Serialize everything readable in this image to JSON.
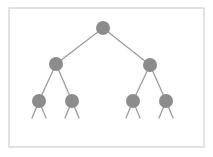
{
  "diagram": {
    "type": "binary-tree",
    "depth_shown": 3,
    "frame": {
      "x": 9,
      "y": 8,
      "width": 195,
      "height": 139,
      "stroke": "#cfcfcf"
    },
    "colors": {
      "node": "#8c8c8c",
      "edge": "#9c9c9c",
      "background": "#ffffff"
    },
    "node_radius": 7,
    "nodes": [
      {
        "id": "root",
        "level": 0,
        "x": 103,
        "y": 28
      },
      {
        "id": "l",
        "level": 1,
        "x": 56,
        "y": 64
      },
      {
        "id": "r",
        "level": 1,
        "x": 150,
        "y": 65
      },
      {
        "id": "ll",
        "level": 2,
        "x": 39,
        "y": 101
      },
      {
        "id": "lr",
        "level": 2,
        "x": 72,
        "y": 101
      },
      {
        "id": "rl",
        "level": 2,
        "x": 133,
        "y": 101
      },
      {
        "id": "rr",
        "level": 2,
        "x": 166,
        "y": 101
      }
    ],
    "edges": [
      {
        "from": "root",
        "to": "l"
      },
      {
        "from": "root",
        "to": "r"
      },
      {
        "from": "l",
        "to": "ll"
      },
      {
        "from": "l",
        "to": "lr"
      },
      {
        "from": "r",
        "to": "rl"
      },
      {
        "from": "r",
        "to": "rr"
      }
    ],
    "truncated_edges": [
      {
        "from": "ll",
        "x2": 32,
        "y2": 118
      },
      {
        "from": "ll",
        "x2": 46,
        "y2": 118
      },
      {
        "from": "lr",
        "x2": 65,
        "y2": 118
      },
      {
        "from": "lr",
        "x2": 79,
        "y2": 118
      },
      {
        "from": "rl",
        "x2": 126,
        "y2": 118
      },
      {
        "from": "rl",
        "x2": 140,
        "y2": 118
      },
      {
        "from": "rr",
        "x2": 159,
        "y2": 118
      },
      {
        "from": "rr",
        "x2": 173,
        "y2": 118
      }
    ]
  }
}
